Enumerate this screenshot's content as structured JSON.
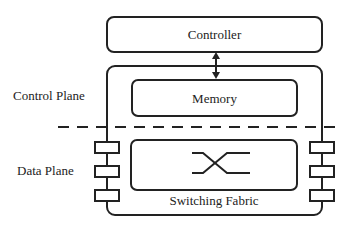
{
  "diagram": {
    "controller": {
      "label": "Controller"
    },
    "memory": {
      "label": "Memory"
    },
    "switching_fabric": {
      "label": "Switching Fabric"
    },
    "planes": {
      "control": "Control Plane",
      "data": "Data Plane"
    },
    "ports": {
      "left_count": 3,
      "right_count": 3
    },
    "colors": {
      "stroke": "#222222",
      "background": "#ffffff"
    }
  }
}
